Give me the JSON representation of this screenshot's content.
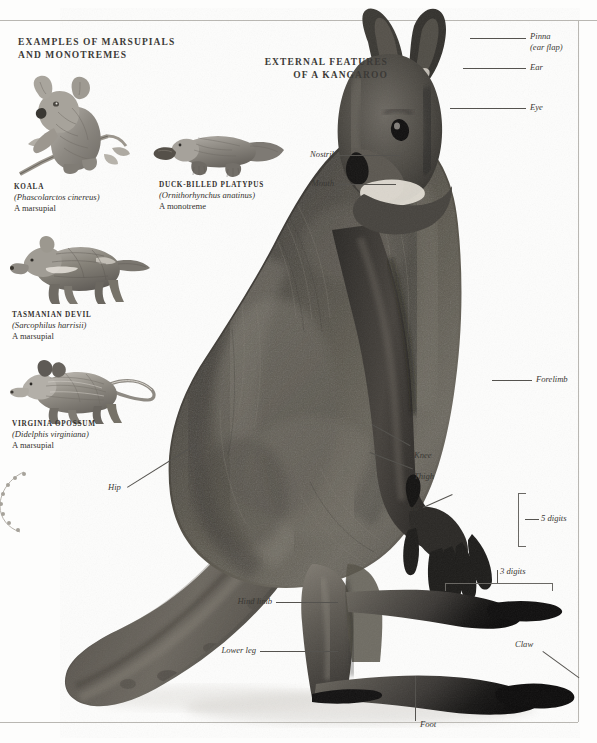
{
  "page": {
    "background": "#fdfdfc",
    "ink": "#2e2c29",
    "rule_color": "#b9b7b2"
  },
  "headings": {
    "left_line1": "EXAMPLES OF MARSUPIALS",
    "left_line2": "AND MONOTREMES",
    "main_line1": "EXTERNAL FEATURES",
    "main_line2": "OF A KANGAROO"
  },
  "specimens": [
    {
      "name": "KOALA",
      "scientific": "(Phascolarctos cinereus)",
      "type": "A marsupial",
      "figure": "koala-illustration"
    },
    {
      "name": "DUCK-BILLED PLATYPUS",
      "scientific": "(Ornithorhynchus anatinus)",
      "type": "A monotreme",
      "figure": "platypus-illustration"
    },
    {
      "name": "TASMANIAN DEVIL",
      "scientific": "(Sarcophilus harrisii)",
      "type": "A marsupial",
      "figure": "tasmanian-devil-illustration"
    },
    {
      "name": "VIRGINIA OPOSSUM",
      "scientific": "(Didelphis virginiana)",
      "type": "A marsupial",
      "figure": "virginia-opossum-illustration"
    }
  ],
  "anatomy_labels": {
    "pinna_line1": "Pinna",
    "pinna_line2": "(ear flap)",
    "ear": "Ear",
    "eye": "Eye",
    "nostril": "Nostril",
    "mouth": "Mouth",
    "forelimb": "Forelimb",
    "knee": "Knee",
    "thigh": "Thigh",
    "claw_fore": "Claw",
    "five_digits": "5 digits",
    "hip": "Hip",
    "three_digits": "3 digits",
    "hind_limb": "Hind limb",
    "lower_leg": "Lower leg",
    "claw_hind": "Claw",
    "foot": "Foot"
  },
  "main_figure": {
    "subject": "kangaroo-photograph",
    "description": "Grey kangaroo standing in profile facing right"
  }
}
